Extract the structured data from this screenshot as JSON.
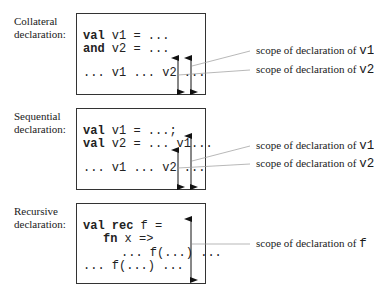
{
  "panels": [
    {
      "id": "collateral",
      "label_line1": "Collateral",
      "label_line2": "declaration:",
      "code": [
        {
          "kw": "val",
          "rest": " v1 = ..."
        },
        {
          "kw": "and",
          "rest": " v2 = ..."
        },
        {
          "kw": "",
          "rest": "... v1 ... v2 ..."
        }
      ],
      "scopes": [
        {
          "prefix": "scope of declaration of ",
          "var": "v1"
        },
        {
          "prefix": "scope of declaration of ",
          "var": "v2"
        }
      ]
    },
    {
      "id": "sequential",
      "label_line1": "Sequential",
      "label_line2": "declaration:",
      "code": [
        {
          "kw": "val",
          "rest": " v1 = ...;"
        },
        {
          "kw": "val",
          "rest": " v2 = ... v1..."
        },
        {
          "kw": "",
          "rest": "... v1 ... v2 ..."
        }
      ],
      "scopes": [
        {
          "prefix": "scope of declaration of ",
          "var": "v1"
        },
        {
          "prefix": "scope of declaration of ",
          "var": "v2"
        }
      ]
    },
    {
      "id": "recursive",
      "label_line1": "Recursive",
      "label_line2": "declaration:",
      "code": [
        {
          "kw": "val rec",
          "rest": " f ="
        },
        {
          "kw": "fn",
          "rest": " x =>"
        },
        {
          "kw": "",
          "rest": "... f(...) ..."
        },
        {
          "kw": "",
          "rest": "... f(...) ..."
        }
      ],
      "scopes": [
        {
          "prefix": "scope of declaration of ",
          "var": "f"
        }
      ]
    }
  ]
}
